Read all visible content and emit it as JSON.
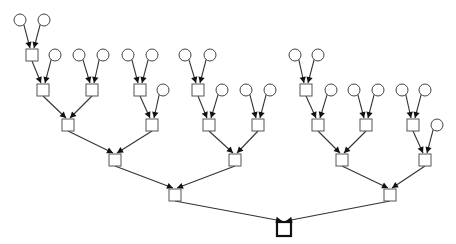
{
  "diagram": {
    "type": "tree",
    "colors": {
      "background": "#ffffff",
      "stroke": "#333333",
      "arrow": "#111111"
    },
    "nodes": [
      {
        "id": "c1",
        "shape": "circle",
        "x": 20,
        "y": 20
      },
      {
        "id": "c2",
        "shape": "circle",
        "x": 44,
        "y": 20
      },
      {
        "id": "A",
        "shape": "square",
        "x": 32,
        "y": 55
      },
      {
        "id": "c3",
        "shape": "circle",
        "x": 55,
        "y": 55
      },
      {
        "id": "c4",
        "shape": "circle",
        "x": 79,
        "y": 55
      },
      {
        "id": "c5",
        "shape": "circle",
        "x": 103,
        "y": 55
      },
      {
        "id": "c6",
        "shape": "circle",
        "x": 128,
        "y": 55
      },
      {
        "id": "c7",
        "shape": "circle",
        "x": 152,
        "y": 55
      },
      {
        "id": "c8",
        "shape": "circle",
        "x": 185,
        "y": 55
      },
      {
        "id": "c9",
        "shape": "circle",
        "x": 210,
        "y": 55
      },
      {
        "id": "c10",
        "shape": "circle",
        "x": 295,
        "y": 55
      },
      {
        "id": "c11",
        "shape": "circle",
        "x": 318,
        "y": 55
      },
      {
        "id": "B",
        "shape": "square",
        "x": 43,
        "y": 90
      },
      {
        "id": "C",
        "shape": "square",
        "x": 92,
        "y": 90
      },
      {
        "id": "D",
        "shape": "square",
        "x": 140,
        "y": 90
      },
      {
        "id": "E",
        "shape": "square",
        "x": 198,
        "y": 90
      },
      {
        "id": "F",
        "shape": "square",
        "x": 306,
        "y": 90
      },
      {
        "id": "c12",
        "shape": "circle",
        "x": 163,
        "y": 90
      },
      {
        "id": "c13",
        "shape": "circle",
        "x": 222,
        "y": 90
      },
      {
        "id": "c14",
        "shape": "circle",
        "x": 246,
        "y": 90
      },
      {
        "id": "c15",
        "shape": "circle",
        "x": 270,
        "y": 90
      },
      {
        "id": "c16",
        "shape": "circle",
        "x": 331,
        "y": 90
      },
      {
        "id": "c17",
        "shape": "circle",
        "x": 354,
        "y": 90
      },
      {
        "id": "c18",
        "shape": "circle",
        "x": 378,
        "y": 90
      },
      {
        "id": "c19",
        "shape": "circle",
        "x": 402,
        "y": 90
      },
      {
        "id": "c20",
        "shape": "circle",
        "x": 425,
        "y": 90
      },
      {
        "id": "G",
        "shape": "square",
        "x": 68,
        "y": 125
      },
      {
        "id": "H",
        "shape": "square",
        "x": 152,
        "y": 125
      },
      {
        "id": "I",
        "shape": "square",
        "x": 209,
        "y": 125
      },
      {
        "id": "J",
        "shape": "square",
        "x": 258,
        "y": 125
      },
      {
        "id": "K",
        "shape": "square",
        "x": 318,
        "y": 125
      },
      {
        "id": "L",
        "shape": "square",
        "x": 366,
        "y": 125
      },
      {
        "id": "M",
        "shape": "square",
        "x": 413,
        "y": 125
      },
      {
        "id": "c21",
        "shape": "circle",
        "x": 437,
        "y": 125
      },
      {
        "id": "N",
        "shape": "square",
        "x": 115,
        "y": 160
      },
      {
        "id": "O",
        "shape": "square",
        "x": 235,
        "y": 160
      },
      {
        "id": "P",
        "shape": "square",
        "x": 342,
        "y": 160
      },
      {
        "id": "Q",
        "shape": "square",
        "x": 425,
        "y": 160
      },
      {
        "id": "R",
        "shape": "square",
        "x": 175,
        "y": 195
      },
      {
        "id": "S",
        "shape": "square",
        "x": 390,
        "y": 195
      },
      {
        "id": "root",
        "shape": "root",
        "x": 284,
        "y": 229
      }
    ],
    "edges": [
      [
        "c1",
        "A"
      ],
      [
        "c2",
        "A"
      ],
      [
        "A",
        "B"
      ],
      [
        "c3",
        "B"
      ],
      [
        "c4",
        "C"
      ],
      [
        "c5",
        "C"
      ],
      [
        "c6",
        "D"
      ],
      [
        "c7",
        "D"
      ],
      [
        "c8",
        "E"
      ],
      [
        "c9",
        "E"
      ],
      [
        "c10",
        "F"
      ],
      [
        "c11",
        "F"
      ],
      [
        "B",
        "G"
      ],
      [
        "C",
        "G"
      ],
      [
        "D",
        "H"
      ],
      [
        "c12",
        "H"
      ],
      [
        "E",
        "I"
      ],
      [
        "c13",
        "I"
      ],
      [
        "c14",
        "J"
      ],
      [
        "c15",
        "J"
      ],
      [
        "F",
        "K"
      ],
      [
        "c16",
        "K"
      ],
      [
        "c17",
        "L"
      ],
      [
        "c18",
        "L"
      ],
      [
        "c19",
        "M"
      ],
      [
        "c20",
        "M"
      ],
      [
        "G",
        "N"
      ],
      [
        "H",
        "N"
      ],
      [
        "I",
        "O"
      ],
      [
        "J",
        "O"
      ],
      [
        "K",
        "P"
      ],
      [
        "L",
        "P"
      ],
      [
        "M",
        "Q"
      ],
      [
        "c21",
        "Q"
      ],
      [
        "N",
        "R"
      ],
      [
        "O",
        "R"
      ],
      [
        "P",
        "S"
      ],
      [
        "Q",
        "S"
      ],
      [
        "R",
        "root"
      ],
      [
        "S",
        "root"
      ]
    ],
    "sizes": {
      "circle_radius": 6,
      "square": 12,
      "root_square": 14
    }
  }
}
